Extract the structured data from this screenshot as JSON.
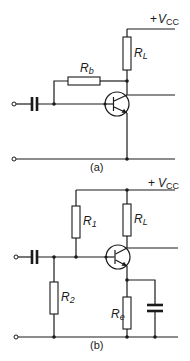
{
  "diagram": {
    "type": "circuit-schematic",
    "panels": [
      {
        "id": "a",
        "caption": "(a)",
        "supply": {
          "prefix": "+",
          "symbol": "V",
          "subscript": "CC"
        },
        "components": [
          {
            "ref": "Rb",
            "symbol": "R",
            "subscript": "b",
            "type": "resistor",
            "connection": "collector to base (feedback bias)"
          },
          {
            "ref": "RL",
            "symbol": "R",
            "subscript": "L",
            "type": "resistor",
            "connection": "Vcc to collector"
          },
          {
            "ref": "Cin",
            "type": "capacitor",
            "connection": "input coupling to base"
          },
          {
            "ref": "Q",
            "type": "npn-transistor"
          }
        ]
      },
      {
        "id": "b",
        "caption": "(b)",
        "supply": {
          "prefix": "+",
          "symbol": "V",
          "subscript": "CC"
        },
        "components": [
          {
            "ref": "R1",
            "symbol": "R",
            "subscript": "1",
            "type": "resistor",
            "connection": "Vcc to base"
          },
          {
            "ref": "R2",
            "symbol": "R",
            "subscript": "2",
            "type": "resistor",
            "connection": "base to ground"
          },
          {
            "ref": "RL",
            "symbol": "R",
            "subscript": "L",
            "type": "resistor",
            "connection": "Vcc to collector"
          },
          {
            "ref": "Re",
            "symbol": "R",
            "subscript": "e",
            "type": "resistor",
            "connection": "emitter to ground"
          },
          {
            "ref": "Ce",
            "type": "capacitor",
            "connection": "emitter bypass to ground"
          },
          {
            "ref": "Cin",
            "type": "capacitor",
            "connection": "input coupling to base"
          },
          {
            "ref": "Q",
            "type": "npn-transistor"
          }
        ]
      }
    ]
  },
  "labels": {
    "a_vcc_prefix": "+",
    "a_vcc_sym": "V",
    "a_vcc_sub": "CC",
    "a_rb_sym": "R",
    "a_rb_sub": "b",
    "a_rl_sym": "R",
    "a_rl_sub": "L",
    "a_caption": "(a)",
    "b_vcc_prefix": "+",
    "b_vcc_sym": "V",
    "b_vcc_sub": "CC",
    "b_r1_sym": "R",
    "b_r1_sub": "1",
    "b_rl_sym": "R",
    "b_rl_sub": "L",
    "b_r2_sym": "R",
    "b_r2_sub": "2",
    "b_re_sym": "R",
    "b_re_sub": "e",
    "b_caption": "(b)"
  }
}
